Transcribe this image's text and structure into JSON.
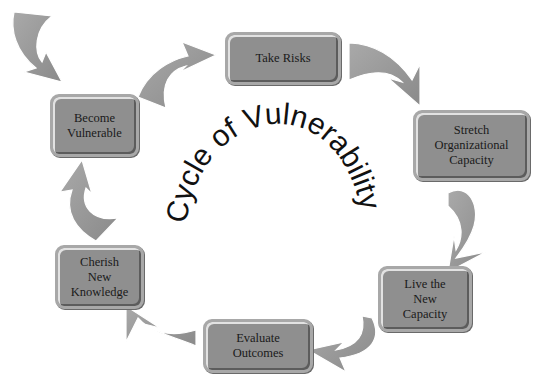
{
  "diagram": {
    "title": "Cycle of Vulnerability",
    "type": "cycle",
    "nodes": [
      {
        "id": "take-risks",
        "label": "Take Risks",
        "lines": [
          "Take Risks"
        ]
      },
      {
        "id": "stretch",
        "label": "Stretch Organizational Capacity",
        "lines": [
          "Stretch",
          "Organizational",
          "Capacity"
        ]
      },
      {
        "id": "live",
        "label": "Live the New Capacity",
        "lines": [
          "Live the",
          "New",
          "Capacity"
        ]
      },
      {
        "id": "evaluate",
        "label": "Evaluate Outcomes",
        "lines": [
          "Evaluate",
          "Outcomes"
        ]
      },
      {
        "id": "cherish",
        "label": "Cherish New Knowledge",
        "lines": [
          "Cherish",
          "New",
          "Knowledge"
        ]
      },
      {
        "id": "become",
        "label": "Become Vulnerable",
        "lines": [
          "Become",
          "Vulnerable"
        ]
      }
    ],
    "edges": [
      {
        "from": "entry",
        "to": "become-vulnerable"
      },
      {
        "from": "become-vulnerable",
        "to": "take-risks"
      },
      {
        "from": "take-risks",
        "to": "stretch"
      },
      {
        "from": "stretch",
        "to": "live"
      },
      {
        "from": "live",
        "to": "evaluate"
      },
      {
        "from": "evaluate",
        "to": "cherish"
      },
      {
        "from": "cherish",
        "to": "become-vulnerable"
      }
    ],
    "colors": {
      "box_fill": "#8f8f8f",
      "box_border": "#a8a8a8",
      "arrow_fill": "#9a9a9a",
      "text": "#1a1a1a"
    }
  }
}
